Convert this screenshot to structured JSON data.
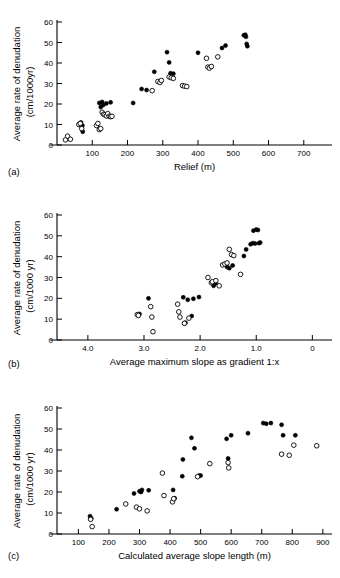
{
  "figure": {
    "panels": [
      {
        "id": "a",
        "label": "(a)",
        "ylabel_line1": "Average rate of denudation",
        "ylabel_line2": "(cm/1000yr)",
        "xlabel": "Relief (m)"
      },
      {
        "id": "b",
        "label": "(b)",
        "ylabel_line1": "Average rate of denudation",
        "ylabel_line2": "(cm/1000 yr)",
        "xlabel": "Average maximum slope as gradient 1:x"
      },
      {
        "id": "c",
        "label": "(c)",
        "ylabel_line1": "Average rate of denudation",
        "ylabel_line2": "(cm/1000 yr)",
        "xlabel": "Calculated average slope length (m)"
      }
    ]
  },
  "chart_data": [
    {
      "type": "scatter",
      "id": "a",
      "title": "",
      "xlabel": "Relief (m)",
      "ylabel": "Average rate of denudation (cm/1000yr)",
      "xlim": [
        0,
        780
      ],
      "ylim": [
        0,
        60
      ],
      "xticks": [
        100,
        200,
        300,
        400,
        500,
        600,
        700
      ],
      "yticks": [
        0,
        10,
        20,
        30,
        40,
        50,
        60
      ],
      "grid": false,
      "legend": "none",
      "series": [
        {
          "name": "filled",
          "marker": "filled-circle",
          "points": [
            [
              68,
              11.0
            ],
            [
              72,
              9.5
            ],
            [
              73,
              6.5
            ],
            [
              120,
              20.5
            ],
            [
              124,
              18.5
            ],
            [
              128,
              21.0
            ],
            [
              131,
              19.5
            ],
            [
              140,
              20.3
            ],
            [
              152,
              20.8
            ],
            [
              216,
              20.5
            ],
            [
              240,
              27.3
            ],
            [
              254,
              26.8
            ],
            [
              276,
              35.7
            ],
            [
              312,
              45.3
            ],
            [
              318,
              40.3
            ],
            [
              322,
              35.0
            ],
            [
              330,
              34.8
            ],
            [
              400,
              45.0
            ],
            [
              468,
              47.3
            ],
            [
              478,
              48.5
            ],
            [
              530,
              53.5
            ],
            [
              534,
              53.8
            ],
            [
              536,
              52.8
            ],
            [
              538,
              49.3
            ],
            [
              540,
              48.2
            ]
          ]
        },
        {
          "name": "open",
          "marker": "open-circle",
          "points": [
            [
              24,
              2.5
            ],
            [
              30,
              4.3
            ],
            [
              38,
              2.8
            ],
            [
              62,
              10.0
            ],
            [
              66,
              10.5
            ],
            [
              70,
              8.0
            ],
            [
              112,
              9.5
            ],
            [
              116,
              10.5
            ],
            [
              120,
              7.5
            ],
            [
              124,
              8.0
            ],
            [
              128,
              16.0
            ],
            [
              132,
              15.0
            ],
            [
              136,
              14.8
            ],
            [
              140,
              14.2
            ],
            [
              144,
              15.3
            ],
            [
              148,
              14.0
            ],
            [
              152,
              13.8
            ],
            [
              156,
              14.0
            ],
            [
              270,
              26.5
            ],
            [
              286,
              31.0
            ],
            [
              292,
              30.5
            ],
            [
              296,
              31.5
            ],
            [
              318,
              33.2
            ],
            [
              324,
              32.8
            ],
            [
              330,
              32.5
            ],
            [
              356,
              29.0
            ],
            [
              362,
              28.7
            ],
            [
              368,
              28.5
            ],
            [
              424,
              42.3
            ],
            [
              428,
              38.0
            ],
            [
              432,
              37.5
            ],
            [
              438,
              38.3
            ],
            [
              456,
              43.0
            ]
          ]
        }
      ]
    },
    {
      "type": "scatter",
      "id": "b",
      "title": "",
      "xlabel": "Average maximum slope as gradient 1:x",
      "ylabel": "Average rate of denudation (cm/1000 yr)",
      "xlim": [
        4.55,
        -0.35
      ],
      "ylim": [
        0,
        60
      ],
      "xticks": [
        4.0,
        3.0,
        2.0,
        1.0,
        0
      ],
      "xtick_labels": [
        "4.0",
        "3.0",
        "2.0",
        "1.0",
        "0"
      ],
      "yticks": [
        0,
        10,
        20,
        30,
        40,
        50,
        60
      ],
      "grid": false,
      "x_axis_reversed": true,
      "legend": "none",
      "series": [
        {
          "name": "filled",
          "marker": "filled-circle",
          "points": [
            [
              3.1,
              12.0
            ],
            [
              3.08,
              12.5
            ],
            [
              2.92,
              20.0
            ],
            [
              2.3,
              20.5
            ],
            [
              2.22,
              19.3
            ],
            [
              2.12,
              19.8
            ],
            [
              2.02,
              20.6
            ],
            [
              2.28,
              8.0
            ],
            [
              2.26,
              8.3
            ],
            [
              2.15,
              11.5
            ],
            [
              1.76,
              26.0
            ],
            [
              1.74,
              27.0
            ],
            [
              1.72,
              27.5
            ],
            [
              1.52,
              35.0
            ],
            [
              1.48,
              34.5
            ],
            [
              1.42,
              35.8
            ],
            [
              1.22,
              40.3
            ],
            [
              1.18,
              43.5
            ],
            [
              1.1,
              46.0
            ],
            [
              1.06,
              46.5
            ],
            [
              1.02,
              46.3
            ],
            [
              1.05,
              52.5
            ],
            [
              1.0,
              53.0
            ],
            [
              0.97,
              52.8
            ],
            [
              0.95,
              46.5
            ],
            [
              0.93,
              46.8
            ]
          ]
        },
        {
          "name": "open",
          "marker": "open-circle",
          "points": [
            [
              3.12,
              12.2
            ],
            [
              3.1,
              11.8
            ],
            [
              2.88,
              16.0
            ],
            [
              2.86,
              11.0
            ],
            [
              2.84,
              4.0
            ],
            [
              2.4,
              17.2
            ],
            [
              2.38,
              13.5
            ],
            [
              2.36,
              11.0
            ],
            [
              2.28,
              8.0
            ],
            [
              2.2,
              10.5
            ],
            [
              1.86,
              30.0
            ],
            [
              1.8,
              27.5
            ],
            [
              1.78,
              28.0
            ],
            [
              1.72,
              28.5
            ],
            [
              1.66,
              26.0
            ],
            [
              1.6,
              36.0
            ],
            [
              1.56,
              36.5
            ],
            [
              1.52,
              37.0
            ],
            [
              1.48,
              43.5
            ],
            [
              1.44,
              41.0
            ],
            [
              1.4,
              40.5
            ],
            [
              1.28,
              31.5
            ]
          ]
        }
      ]
    },
    {
      "type": "scatter",
      "id": "c",
      "title": "",
      "xlabel": "Calculated average slope length (m)",
      "ylabel": "Average rate of denudation (cm/1000 yr)",
      "xlim": [
        30,
        930
      ],
      "ylim": [
        0,
        60
      ],
      "xticks": [
        100,
        200,
        300,
        400,
        500,
        600,
        700,
        800,
        900
      ],
      "yticks": [
        0,
        10,
        20,
        30,
        40,
        50,
        60
      ],
      "grid": false,
      "legend": "none",
      "series": [
        {
          "name": "filled",
          "marker": "filled-circle",
          "points": [
            [
              138,
              8.5
            ],
            [
              142,
              7.5
            ],
            [
              225,
              11.8
            ],
            [
              282,
              19.3
            ],
            [
              300,
              20.3
            ],
            [
              305,
              20.0
            ],
            [
              308,
              21.0
            ],
            [
              330,
              20.8
            ],
            [
              410,
              21.0
            ],
            [
              415,
              17.0
            ],
            [
              440,
              27.5
            ],
            [
              442,
              35.5
            ],
            [
              470,
              45.8
            ],
            [
              480,
              40.8
            ],
            [
              495,
              27.8
            ],
            [
              500,
              27.8
            ],
            [
              585,
              45.3
            ],
            [
              590,
              36.0
            ],
            [
              600,
              47.0
            ],
            [
              655,
              48.0
            ],
            [
              705,
              52.8
            ],
            [
              715,
              52.5
            ],
            [
              730,
              52.8
            ],
            [
              765,
              52.0
            ],
            [
              770,
              47.0
            ],
            [
              810,
              47.0
            ]
          ]
        },
        {
          "name": "open",
          "marker": "open-circle",
          "points": [
            [
              140,
              7.0
            ],
            [
              145,
              3.5
            ],
            [
              255,
              14.3
            ],
            [
              290,
              12.8
            ],
            [
              300,
              12.0
            ],
            [
              325,
              11.0
            ],
            [
              375,
              29.0
            ],
            [
              380,
              18.3
            ],
            [
              408,
              15.3
            ],
            [
              412,
              16.8
            ],
            [
              490,
              27.3
            ],
            [
              530,
              33.5
            ],
            [
              590,
              34.0
            ],
            [
              592,
              31.5
            ],
            [
              765,
              38.0
            ],
            [
              790,
              37.5
            ],
            [
              805,
              42.3
            ],
            [
              880,
              42.0
            ]
          ]
        }
      ]
    }
  ]
}
